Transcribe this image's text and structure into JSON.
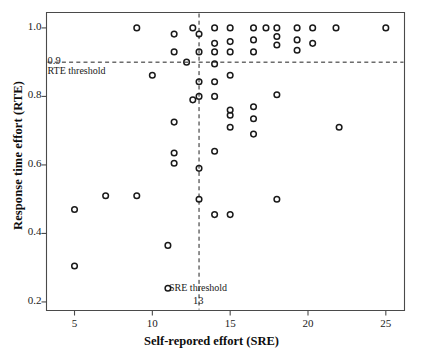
{
  "chart_data": {
    "type": "scatter",
    "title": "",
    "xlabel": "Self-repored effort (SRE)",
    "ylabel": "Response time effort (RTE)",
    "xlim": [
      3.2,
      26.2
    ],
    "ylim": [
      0.175,
      1.045
    ],
    "xticks": [
      5,
      10,
      15,
      20,
      25
    ],
    "xtick_labels": [
      "5",
      "10",
      "15",
      "20",
      "25"
    ],
    "yticks": [
      0.2,
      0.4,
      0.6,
      0.8,
      1.0
    ],
    "ytick_labels": [
      "0.2",
      "0.4",
      "0.6",
      "0.8",
      "1.0"
    ],
    "grid": false,
    "legend": "none",
    "marker": "open-circle",
    "marker_color": "#1a1a1a",
    "annotations": [
      {
        "name": "rte-threshold-line",
        "type": "hline",
        "y": 0.9,
        "label": "RTE threshold",
        "value_label": "0.9",
        "style": "dashed"
      },
      {
        "name": "sre-threshold-line",
        "type": "vline",
        "x": 13,
        "label": "SRE threshold",
        "value_label": "13",
        "style": "dashed"
      }
    ],
    "points": [
      {
        "x": 5.0,
        "y": 0.47
      },
      {
        "x": 5.0,
        "y": 0.305
      },
      {
        "x": 7.0,
        "y": 0.51
      },
      {
        "x": 9.0,
        "y": 1.0
      },
      {
        "x": 9.0,
        "y": 0.51
      },
      {
        "x": 10.0,
        "y": 0.862
      },
      {
        "x": 11.0,
        "y": 0.365
      },
      {
        "x": 11.0,
        "y": 0.24
      },
      {
        "x": 11.4,
        "y": 0.982
      },
      {
        "x": 11.4,
        "y": 0.93
      },
      {
        "x": 11.4,
        "y": 0.725
      },
      {
        "x": 11.4,
        "y": 0.635
      },
      {
        "x": 11.4,
        "y": 0.605
      },
      {
        "x": 12.2,
        "y": 0.9
      },
      {
        "x": 12.6,
        "y": 1.0
      },
      {
        "x": 12.6,
        "y": 0.79
      },
      {
        "x": 13.0,
        "y": 0.982
      },
      {
        "x": 13.0,
        "y": 0.93
      },
      {
        "x": 13.0,
        "y": 0.843
      },
      {
        "x": 13.0,
        "y": 0.8
      },
      {
        "x": 13.0,
        "y": 0.59
      },
      {
        "x": 13.0,
        "y": 0.5
      },
      {
        "x": 14.0,
        "y": 1.0
      },
      {
        "x": 14.0,
        "y": 0.955
      },
      {
        "x": 14.0,
        "y": 0.93
      },
      {
        "x": 14.0,
        "y": 0.895
      },
      {
        "x": 14.0,
        "y": 0.843
      },
      {
        "x": 14.0,
        "y": 0.8
      },
      {
        "x": 14.0,
        "y": 0.64
      },
      {
        "x": 14.0,
        "y": 0.455
      },
      {
        "x": 15.0,
        "y": 1.0
      },
      {
        "x": 15.0,
        "y": 0.96
      },
      {
        "x": 15.0,
        "y": 0.93
      },
      {
        "x": 15.0,
        "y": 0.862
      },
      {
        "x": 15.0,
        "y": 0.76
      },
      {
        "x": 15.0,
        "y": 0.745
      },
      {
        "x": 15.0,
        "y": 0.71
      },
      {
        "x": 15.0,
        "y": 0.455
      },
      {
        "x": 16.5,
        "y": 1.0
      },
      {
        "x": 16.5,
        "y": 0.965
      },
      {
        "x": 16.5,
        "y": 0.93
      },
      {
        "x": 16.5,
        "y": 0.77
      },
      {
        "x": 16.5,
        "y": 0.735
      },
      {
        "x": 16.5,
        "y": 0.69
      },
      {
        "x": 17.3,
        "y": 1.0
      },
      {
        "x": 18.0,
        "y": 1.0
      },
      {
        "x": 18.0,
        "y": 0.975
      },
      {
        "x": 18.0,
        "y": 0.95
      },
      {
        "x": 18.0,
        "y": 0.805
      },
      {
        "x": 18.0,
        "y": 0.5
      },
      {
        "x": 19.3,
        "y": 1.0
      },
      {
        "x": 19.3,
        "y": 0.965
      },
      {
        "x": 19.3,
        "y": 0.935
      },
      {
        "x": 20.3,
        "y": 1.0
      },
      {
        "x": 20.3,
        "y": 0.955
      },
      {
        "x": 21.8,
        "y": 1.0
      },
      {
        "x": 22.0,
        "y": 0.71
      },
      {
        "x": 25.0,
        "y": 1.0
      }
    ]
  }
}
